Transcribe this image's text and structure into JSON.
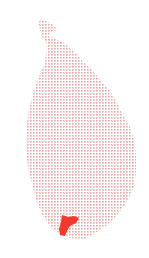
{
  "map": {
    "title": "",
    "region": "Sri Lanka",
    "base_fill": "dotted",
    "dot_color": "#e9a3a3",
    "background_color": "#ffffff",
    "highlight_color": "#f3392b",
    "highlighted_area": {
      "name": "",
      "location": "southern"
    }
  }
}
